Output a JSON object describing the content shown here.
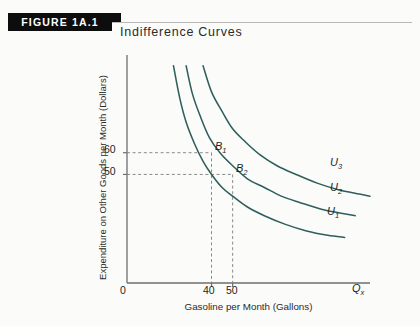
{
  "figure": {
    "banner_label": "FIGURE 1A.1",
    "title": "Indifference Curves"
  },
  "colors": {
    "curve": "#2f5f5c",
    "banner_bg": "#0d0d0d",
    "banner_text": "#ffffff",
    "axis": "#6e6e6e",
    "guide_dash": "#8a8a8a",
    "background": "#fbfbf9"
  },
  "chart_data": {
    "type": "line",
    "title": "Indifference Curves",
    "xlabel": "Gasoline per Month (Gallons)",
    "ylabel": "Expenditure on Other Goods per Month (Dollars)",
    "x_axis_variable": "Q",
    "x_axis_variable_subscript": "x",
    "origin_label": "0",
    "xlim": [
      0,
      115
    ],
    "ylim": [
      0,
      105
    ],
    "xticks": [
      40,
      50
    ],
    "xtick_labels": [
      "40",
      "50"
    ],
    "yticks": [
      50,
      60
    ],
    "ytick_labels": [
      "50",
      "60"
    ],
    "grid": false,
    "legend_position": "inline-right-of-curve",
    "series": [
      {
        "name": "U1",
        "label": "U",
        "label_subscript": "1",
        "points": [
          [
            22,
            100
          ],
          [
            25,
            85
          ],
          [
            28,
            74
          ],
          [
            32,
            64
          ],
          [
            36,
            56
          ],
          [
            40,
            50
          ],
          [
            45,
            44
          ],
          [
            50,
            40
          ],
          [
            57,
            35
          ],
          [
            65,
            31
          ],
          [
            75,
            27
          ],
          [
            85,
            24
          ],
          [
            95,
            22
          ],
          [
            103,
            21
          ]
        ]
      },
      {
        "name": "U2",
        "label": "U",
        "label_subscript": "2",
        "points": [
          [
            28,
            100
          ],
          [
            31,
            87
          ],
          [
            35,
            76
          ],
          [
            39,
            67
          ],
          [
            44,
            60
          ],
          [
            50,
            54
          ],
          [
            57,
            48
          ],
          [
            65,
            44
          ],
          [
            73,
            40
          ],
          [
            82,
            37
          ],
          [
            92,
            34
          ],
          [
            102,
            32
          ],
          [
            108,
            31
          ]
        ]
      },
      {
        "name": "U3",
        "label": "U",
        "label_subscript": "3",
        "points": [
          [
            36,
            100
          ],
          [
            40,
            88
          ],
          [
            45,
            79
          ],
          [
            50,
            71
          ],
          [
            56,
            65
          ],
          [
            63,
            59
          ],
          [
            71,
            54
          ],
          [
            80,
            50
          ],
          [
            90,
            46
          ],
          [
            100,
            43
          ],
          [
            110,
            41
          ],
          [
            115,
            40
          ]
        ]
      }
    ],
    "annotations": [
      {
        "name": "B1",
        "label": "B",
        "label_subscript": "1",
        "x": 40,
        "y": 60,
        "on_curve": "U2",
        "guides": [
          "horizontal",
          "vertical"
        ]
      },
      {
        "name": "B2",
        "label": "B",
        "label_subscript": "2",
        "x": 50,
        "y": 50,
        "on_curve": "U2",
        "guides": [
          "horizontal",
          "vertical"
        ]
      }
    ]
  }
}
